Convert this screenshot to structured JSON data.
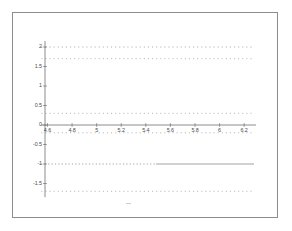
{
  "chart_data": {
    "type": "line",
    "title": "",
    "xlabel": "",
    "ylabel": "",
    "xlim": [
      4.5,
      6.3
    ],
    "ylim": [
      -1.85,
      2.15
    ],
    "grid": false,
    "legend": null,
    "xticks": [
      "4.6",
      "4.8",
      "5",
      "5.2",
      "5.4",
      "5.6",
      "5.8",
      "6",
      "6.2"
    ],
    "xtick_values": [
      4.6,
      4.8,
      5.0,
      5.2,
      5.4,
      5.6,
      5.8,
      6.0,
      6.2
    ],
    "yticks": [
      "2",
      "1.5",
      "1",
      "0.5",
      "0",
      "-0.5",
      "-1",
      "-1.5"
    ],
    "ytick_values": [
      2,
      1.5,
      1,
      0.5,
      0,
      -0.5,
      -1,
      -1.5
    ],
    "x_start": 4.55,
    "x_end": 6.28,
    "series": [
      {
        "name": "level-2.00",
        "style": "dotted",
        "y": 2.0,
        "color": "#9a9a9a"
      },
      {
        "name": "level-1.70",
        "style": "dotted",
        "y": 1.7,
        "color": "#a6a6a6"
      },
      {
        "name": "level-0.30",
        "style": "dotted",
        "y": 0.3,
        "color": "#a6a6a6"
      },
      {
        "name": "level--0.20",
        "style": "dotted",
        "y": -0.2,
        "color": "#a6a6a6"
      },
      {
        "name": "level--1.00",
        "style": "dotted-to-solid",
        "y": -1.0,
        "color": "#8a8a8a"
      },
      {
        "name": "level--1.70",
        "style": "dotted",
        "y": -1.7,
        "color": "#a6a6a6"
      }
    ],
    "axes": {
      "x_axis_y": 0,
      "y_axis_x": 4.58,
      "axis_color": "#6f6f6f"
    }
  }
}
